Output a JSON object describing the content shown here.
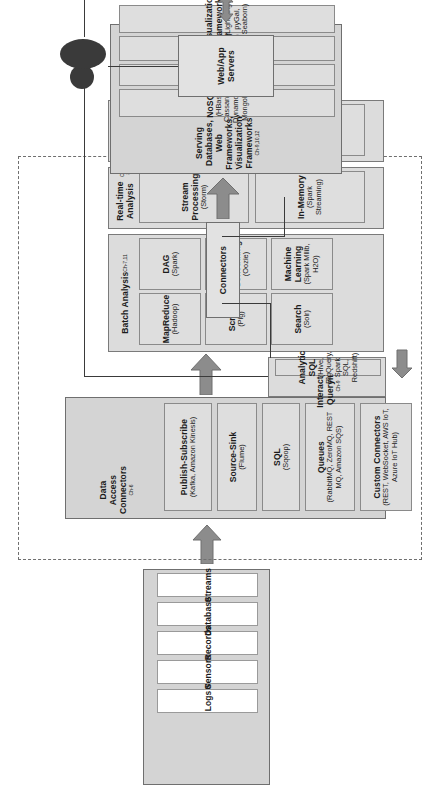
{
  "diagram": {
    "orientation": "rotated-90-ccw",
    "colors": {
      "group_fill": "#d4d4d4",
      "card_fill": "#dedede",
      "card_light_fill": "#ffffff",
      "border": "#6f6f6f",
      "arrow": "#8c8c8c",
      "line": "#3a3a3a",
      "text": "#1b1b1b"
    }
  },
  "user": {
    "icon": "user-silhouette-icon",
    "label": ""
  },
  "web_app_servers": {
    "label": "Web/App Servers"
  },
  "serving": {
    "title": "Serving Databases, Web Frameworks, Visualization Frameworks",
    "chapter": "Ch-9,10,12",
    "items": [
      {
        "name": "NoSQL",
        "detail": "(HBase, Cassandra, DynamoDB, MongoDB)"
      },
      {
        "name": "SQL",
        "detail": "(MySQL)"
      },
      {
        "name": "Web Frameworks",
        "detail": "(Django)"
      },
      {
        "name": "Visualization Frameworks",
        "detail": "(Lightning, pyGal, Seaborn)"
      }
    ]
  },
  "connectors": {
    "label": "Connectors"
  },
  "interactive_querying": {
    "title": "Interactive Querying",
    "chapter": "Ch-9",
    "items": [
      {
        "name": "Analytic SQL",
        "detail": "(Hive, BigQuery, Spark SQL, Redshift)"
      }
    ]
  },
  "batch_analysis": {
    "title": "Batch Analysis",
    "chapter": "Ch-7,11",
    "items": [
      {
        "name": "MapReduce",
        "detail": "(Hadoop)"
      },
      {
        "name": "DAG",
        "detail": "(Spark)"
      },
      {
        "name": "Script",
        "detail": "(Pig)"
      },
      {
        "name": "Workflow Scheduling",
        "detail": "(Oozie)"
      },
      {
        "name": "Search",
        "detail": "(Solr)"
      },
      {
        "name": "Machine Learning",
        "detail": "(Spark Mllib, H2O)"
      }
    ]
  },
  "realtime_analysis": {
    "title": "Real-time Analysis",
    "chapter": "Ch-8",
    "items": [
      {
        "name": "Stream Processing",
        "detail": "(Storm)"
      },
      {
        "name": "In-Memory",
        "detail": "(Spark Streaming)"
      }
    ]
  },
  "data_storage": {
    "title": "Data Storage",
    "chapter": "Ch-6",
    "items": [
      {
        "name": "Distributed Filesystem",
        "detail": "(HDFS)"
      },
      {
        "name": "NoSQL",
        "detail": "(HBase)"
      }
    ]
  },
  "data_access_connectors": {
    "title": "Data Access Connectors",
    "chapter": "Ch-6",
    "items": [
      {
        "name": "Publish-Subscribe",
        "detail": "(Kafka, Amazon Kinesis)"
      },
      {
        "name": "Source-Sink",
        "detail": "(Flume)"
      },
      {
        "name": "SQL",
        "detail": "(Sqoop)"
      },
      {
        "name": "Queues",
        "detail": "(RabbitMQ, ZeroMQ, REST MQ, Amazon SQS)"
      },
      {
        "name": "Custom Connectors",
        "detail": "(REST, WebSocket, AWS IoT, Azure IoT Hub)"
      }
    ]
  },
  "raw_data": {
    "title": "Raw Data",
    "items": [
      {
        "name": "Logs"
      },
      {
        "name": "Sensors"
      },
      {
        "name": "Records"
      },
      {
        "name": "Databases"
      },
      {
        "name": "Streams"
      }
    ]
  }
}
